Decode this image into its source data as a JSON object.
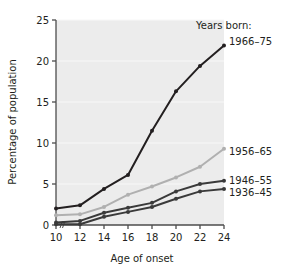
{
  "chart_data": {
    "type": "line",
    "title": "",
    "xlabel": "Age of onset",
    "ylabel": "Percentage of population",
    "x": [
      10,
      12,
      14,
      16,
      18,
      20,
      22,
      24
    ],
    "xticklabels": [
      "10",
      "12",
      "14",
      "16",
      "18",
      "20",
      "22",
      "24"
    ],
    "yticks": [
      0,
      5,
      10,
      15,
      20,
      25
    ],
    "yticklabels": [
      "0",
      "5",
      "10",
      "15",
      "20",
      "25"
    ],
    "xlim": [
      10,
      24
    ],
    "ylim": [
      0,
      25
    ],
    "grid": true,
    "legend_position": "inline-right",
    "legend_heading": "Years born:",
    "series": [
      {
        "name": "1966–75",
        "color": "#231f20",
        "values": [
          2.0,
          2.4,
          4.4,
          6.1,
          11.5,
          16.3,
          19.4,
          21.9
        ]
      },
      {
        "name": "1956–65",
        "color": "#b0b0b0",
        "values": [
          1.2,
          1.3,
          2.2,
          3.7,
          4.7,
          5.8,
          7.1,
          9.3
        ]
      },
      {
        "name": "1946–55",
        "color": "#3a3a3a",
        "values": [
          0.3,
          0.5,
          1.5,
          2.1,
          2.7,
          4.1,
          5.0,
          5.4
        ]
      },
      {
        "name": "1936–45",
        "color": "#3a3a3a",
        "values": [
          0.1,
          0.1,
          1.0,
          1.6,
          2.2,
          3.2,
          4.1,
          4.4
        ]
      }
    ],
    "axis_break_marker": true,
    "plot_background": "#ececec"
  },
  "labels": {
    "legend_heading": "Years born:",
    "series_1966_75": "1966–75",
    "series_1956_65": "1956–65",
    "series_1946_55": "1946–55",
    "series_1936_45": "1936–45",
    "ylabel": "Percentage of population",
    "xlabel": "Age of onset",
    "ytick_0": "0",
    "ytick_5": "5",
    "ytick_10": "10",
    "ytick_15": "15",
    "ytick_20": "20",
    "ytick_25": "25",
    "xtick_10": "10",
    "xtick_12": "12",
    "xtick_14": "14",
    "xtick_16": "16",
    "xtick_18": "18",
    "xtick_20": "20",
    "xtick_22": "22",
    "xtick_24": "24"
  },
  "colors": {
    "dark": "#231f20",
    "mid_dark": "#3a3a3a",
    "gray": "#b0b0b0",
    "plot_bg": "#ececec",
    "gridline": "#f7f7f7",
    "axis": "#4d4d4d"
  }
}
